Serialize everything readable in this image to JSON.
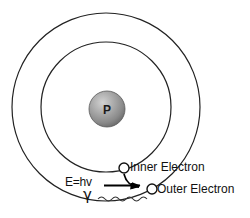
{
  "diagram": {
    "nucleus": {
      "symbol": "P",
      "name": "proton-nucleus",
      "cx": 107,
      "cy": 109,
      "r": 18,
      "fill_light": "#c8c8c8",
      "fill_dark": "#6e6e6e",
      "stroke": "#555555"
    },
    "shells": [
      {
        "name": "outer-shell",
        "cx": 106,
        "cy": 107,
        "r": 94,
        "stroke": "#222222",
        "stroke_width": 1.2
      },
      {
        "name": "inner-shell",
        "cx": 106,
        "cy": 107,
        "r": 65,
        "stroke": "#222222",
        "stroke_width": 1.2
      }
    ],
    "electrons": [
      {
        "name": "inner-electron",
        "label": "Inner Electron",
        "cx": 124,
        "cy": 168,
        "r": 5,
        "fill": "#ffffff",
        "stroke": "#111111"
      },
      {
        "name": "outer-electron",
        "label": "Outer Electron",
        "cx": 152,
        "cy": 189,
        "r": 5,
        "fill": "#ffffff",
        "stroke": "#111111"
      }
    ],
    "annotations": {
      "energy_label": "E=hv",
      "photon_symbol": "γ",
      "inner_electron_label": "Inner Electron",
      "outer_electron_label": "Outer Electron"
    },
    "colors": {
      "background": "#ffffff",
      "line": "#222222",
      "text": "#111111",
      "arrow": "#000000"
    }
  }
}
